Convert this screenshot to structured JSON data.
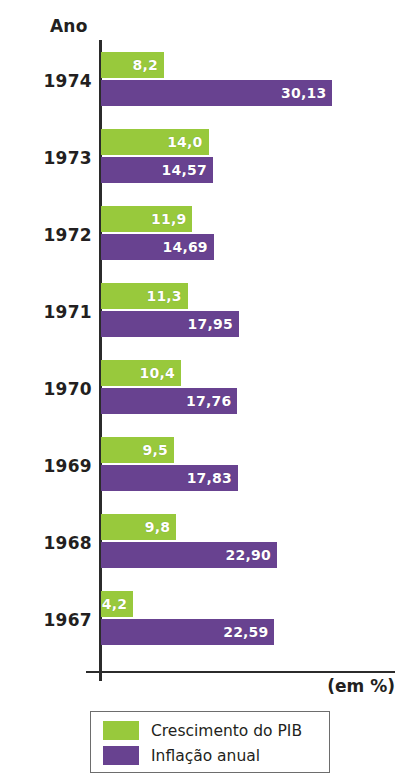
{
  "chart_data": {
    "type": "bar",
    "orientation": "horizontal",
    "title": "",
    "axis_header": "Ano",
    "unit_note": "(em %)",
    "xlabel": "",
    "ylabel": "Ano",
    "xlim": [
      0,
      31
    ],
    "grid": false,
    "legend_position": "bottom",
    "categories": [
      "1974",
      "1973",
      "1972",
      "1971",
      "1970",
      "1969",
      "1968",
      "1967"
    ],
    "series": [
      {
        "name": "Crescimento do PIB",
        "color": "#98c93c",
        "values": [
          8.2,
          14.0,
          11.9,
          11.3,
          10.4,
          9.5,
          9.8,
          4.2
        ],
        "labels": [
          "8,2",
          "14,0",
          "11,9",
          "11,3",
          "10,4",
          "9,5",
          "9,8",
          "4,2"
        ]
      },
      {
        "name": "Inflação anual",
        "color": "#684290",
        "values": [
          30.13,
          14.57,
          14.69,
          17.95,
          17.76,
          17.83,
          22.9,
          22.59
        ],
        "labels": [
          "30,13",
          "14,57",
          "14,69",
          "17,95",
          "17,76",
          "17,83",
          "22,90",
          "22,59"
        ]
      }
    ]
  },
  "legend": {
    "entries": [
      {
        "label": "Crescimento do PIB",
        "color": "#98c93c"
      },
      {
        "label": "Inflação anual",
        "color": "#684290"
      }
    ]
  }
}
